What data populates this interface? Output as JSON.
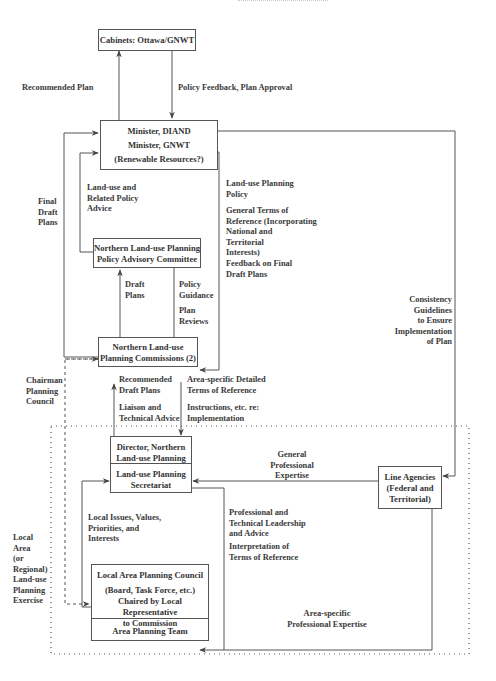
{
  "figure": {
    "header_fragment": "",
    "boxes": {
      "cabinets": {
        "lines": [
          "Cabinets: Ottawa/GNWT"
        ]
      },
      "minister": {
        "lines": [
          "Minister, DIAND",
          "Minister, GNWT",
          "(Renewable Resources?)"
        ]
      },
      "advisory": {
        "lines": [
          "Northern Land-use Planning",
          "Policy Advisory Committee"
        ]
      },
      "commissions": {
        "lines": [
          "Northern Land-use",
          "Planning Commissions (2)"
        ]
      },
      "director": {
        "lines": [
          "Director, Northern",
          "Land-use Planning"
        ]
      },
      "secretariat": {
        "lines": [
          "Land-use Planning",
          "Secretariat"
        ]
      },
      "line_agencies": {
        "lines": [
          "Line Agencies",
          "(Federal and",
          "Territorial)"
        ]
      },
      "council": {
        "lines": [
          "Local Area Planning Council",
          "(Board, Task Force, etc.)",
          "Chaired by Local Representative",
          "to Commission"
        ]
      },
      "team": {
        "lines": [
          "Area Planning Team"
        ]
      }
    },
    "labels": {
      "recommended_plan": [
        "Recommended Plan"
      ],
      "policy_feedback": [
        "Policy Feedback, Plan Approval"
      ],
      "final_draft_plans": [
        "Final",
        "Draft",
        "Plans"
      ],
      "landuse_related_advice": [
        "Land-use and",
        "Related Policy",
        "Advice"
      ],
      "landuse_policy": [
        "Land-use Planning",
        "Policy"
      ],
      "general_terms": [
        "General Terms of",
        "Reference (Incorporating",
        "National and",
        "Territorial",
        "Interests)"
      ],
      "feedback_final": [
        "Feedback on Final",
        "Draft Plans"
      ],
      "draft_plans": [
        "Draft",
        "Plans"
      ],
      "policy_guidance": [
        "Policy",
        "Guidance"
      ],
      "plan_reviews": [
        "Plan",
        "Reviews"
      ],
      "consistency": [
        "Consistency",
        "Guidelines",
        "to Ensure",
        "Implementation",
        "of Plan"
      ],
      "chairman": [
        "Chairman",
        "Planning",
        "Council"
      ],
      "recommended_draft": [
        "Recommended",
        "Draft Plans"
      ],
      "liaison": [
        "Liaison and",
        "Technical Advice"
      ],
      "area_specific_terms": [
        "Area-specific Detailed",
        "Terms of Reference"
      ],
      "instructions": [
        "Instructions, etc. re:",
        "Implementation"
      ],
      "general_expertise": [
        "General",
        "Professional",
        "Expertise"
      ],
      "local_issues": [
        "Local Issues, Values,",
        "Priorities, and",
        "Interests"
      ],
      "professional_leadership": [
        "Professional and",
        "Technical Leadership",
        "and Advice"
      ],
      "interpretation": [
        "Interpretation of",
        "Terms of Reference"
      ],
      "area_specific_expertise": [
        "Area-specific",
        "Professional Expertise"
      ],
      "local_area_exercise": [
        "Local",
        "Area",
        "(or",
        "Regional)",
        "Land-use",
        "Planning",
        "Exercise"
      ]
    },
    "colors": {
      "line": "#555555",
      "text": "#333333",
      "background": "#ffffff"
    }
  }
}
